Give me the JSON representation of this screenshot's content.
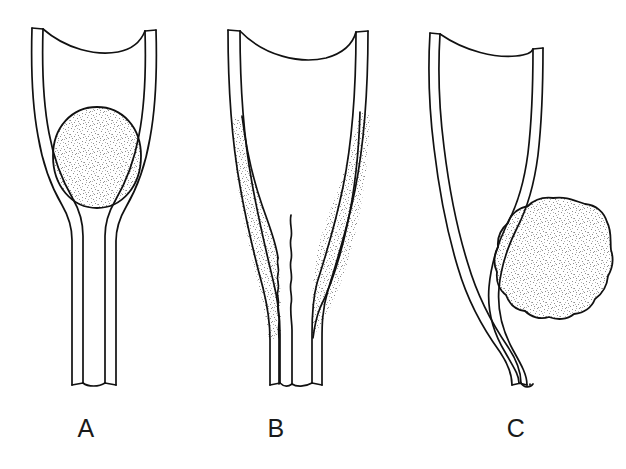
{
  "figure": {
    "background_color": "#ffffff",
    "ink_color": "#111111",
    "stipple_color": "#8a8a8a",
    "caption": "",
    "panels": [
      {
        "id": "A",
        "label": "A",
        "label_x": 86,
        "label_y": 430,
        "description": "Tubular structure with rounded stippled mass filling the lumen, tapering to a narrow stalk below",
        "mass": {
          "shape": "round",
          "center_x": 97,
          "center_y": 157,
          "radius_x": 44,
          "radius_y": 50,
          "fill": "stipple"
        },
        "tube": {
          "top_y": 28,
          "bottom_y": 386,
          "top_left_outer_x": 32,
          "top_right_outer_x": 156,
          "stalk_left_x": 72,
          "stalk_right_x": 106,
          "wall_thickness": 11
        }
      },
      {
        "id": "B",
        "label": "B",
        "label_x": 276,
        "label_y": 430,
        "description": "Tubular structure with stippled mass lining both walls, leaving a narrow wavy central lumen down to the stalk",
        "mass": {
          "shape": "bilateral-lining",
          "fill": "stipple"
        },
        "tube": {
          "top_y": 30,
          "bottom_y": 386,
          "top_left_outer_x": 228,
          "top_right_outer_x": 368,
          "stalk_left_x": 279,
          "stalk_right_x": 313,
          "wall_thickness": 12
        }
      },
      {
        "id": "C",
        "label": "C",
        "label_x": 516,
        "label_y": 430,
        "description": "Tubular structure deviated and compressed to the left by an adjacent lobulated stippled mass lying outside the lumen",
        "mass": {
          "shape": "lobulated",
          "center_x": 553,
          "center_y": 259,
          "radius_x": 58,
          "radius_y": 61,
          "fill": "stipple"
        },
        "tube": {
          "top_y": 33,
          "bottom_y": 386,
          "top_left_outer_x": 430,
          "top_right_outer_x": 543,
          "stalk_left_x": 512,
          "stalk_right_x": 546,
          "wall_thickness": 10
        }
      }
    ]
  }
}
